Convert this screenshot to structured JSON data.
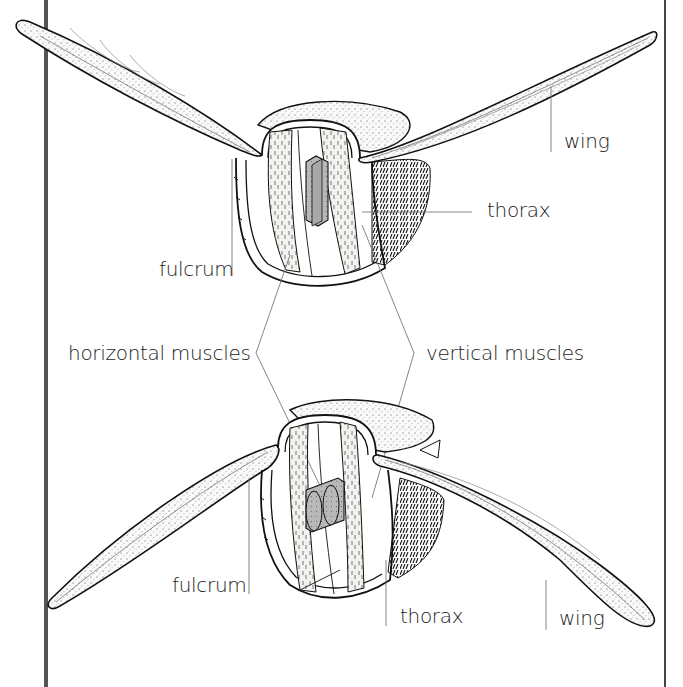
{
  "diagram": {
    "upper_figure": {
      "state": "wings up",
      "labels": {
        "wing": "wing",
        "thorax": "thorax",
        "fulcrum": "fulcrum"
      }
    },
    "shared_labels": {
      "horizontal_muscles": "horizontal muscles",
      "vertical_muscles": "vertical muscles"
    },
    "lower_figure": {
      "state": "wings down",
      "labels": {
        "fulcrum": "fulcrum",
        "thorax": "thorax",
        "wing": "wing"
      }
    }
  },
  "colors": {
    "line": "#1a1a1a",
    "leader": "#777777",
    "muscle_shade": "#eeeeea",
    "organ_fill": "#b8b8b8",
    "frame_left": "#555555",
    "frame_right": "#444444",
    "background": "#ffffff"
  }
}
